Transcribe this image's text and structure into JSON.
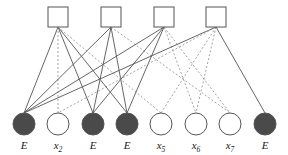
{
  "diagram": {
    "type": "bipartite-factor-graph",
    "width": 288,
    "height": 155,
    "background_color": "#ffffff"
  },
  "style": {
    "edge_solid_color": "#555555",
    "edge_dashed_color": "#999999",
    "edge_width": 0.9,
    "dash_pattern": "2,2",
    "node_stroke_color": "#555555",
    "node_stroke_width": 1.0,
    "check_fill": "#ffffff",
    "var_fill_erased": "#4a4a4a",
    "var_fill_known": "#ffffff",
    "label_color": "#1a1a1a"
  },
  "check_nodes": [
    {
      "id": "c1",
      "label": "",
      "cx": 58,
      "cy": 17,
      "size": 20
    },
    {
      "id": "c2",
      "label": "",
      "cx": 111,
      "cy": 17,
      "size": 20
    },
    {
      "id": "c3",
      "label": "",
      "cx": 164,
      "cy": 17,
      "size": 20
    },
    {
      "id": "c4",
      "label": "",
      "cx": 216,
      "cy": 17,
      "size": 20
    }
  ],
  "variable_nodes": [
    {
      "id": "v1",
      "label": "E",
      "sub": "",
      "cx": 24,
      "cy": 124,
      "r": 11,
      "state": "erased"
    },
    {
      "id": "v2",
      "label": "x",
      "sub": "2",
      "cx": 58,
      "cy": 124,
      "r": 11,
      "state": "known"
    },
    {
      "id": "v3",
      "label": "E",
      "sub": "",
      "cx": 93,
      "cy": 124,
      "r": 11,
      "state": "erased"
    },
    {
      "id": "v4",
      "label": "E",
      "sub": "",
      "cx": 127,
      "cy": 124,
      "r": 11,
      "state": "erased"
    },
    {
      "id": "v5",
      "label": "x",
      "sub": "5",
      "cx": 161,
      "cy": 124,
      "r": 11,
      "state": "known"
    },
    {
      "id": "v6",
      "label": "x",
      "sub": "6",
      "cx": 196,
      "cy": 124,
      "r": 11,
      "state": "known"
    },
    {
      "id": "v7",
      "label": "x",
      "sub": "7",
      "cx": 230,
      "cy": 124,
      "r": 11,
      "state": "known"
    },
    {
      "id": "v8",
      "label": "E",
      "sub": "",
      "cx": 265,
      "cy": 124,
      "r": 11,
      "state": "erased"
    }
  ],
  "edges": [
    {
      "from": "c1",
      "to": "v1",
      "style": "solid"
    },
    {
      "from": "c1",
      "to": "v2",
      "style": "dashed"
    },
    {
      "from": "c1",
      "to": "v3",
      "style": "solid"
    },
    {
      "from": "c1",
      "to": "v4",
      "style": "solid"
    },
    {
      "from": "c1",
      "to": "v5",
      "style": "dashed"
    },
    {
      "from": "c2",
      "to": "v1",
      "style": "solid"
    },
    {
      "from": "c2",
      "to": "v3",
      "style": "solid"
    },
    {
      "from": "c2",
      "to": "v4",
      "style": "solid"
    },
    {
      "from": "c2",
      "to": "v7",
      "style": "dashed"
    },
    {
      "from": "c3",
      "to": "v1",
      "style": "solid"
    },
    {
      "from": "c3",
      "to": "v3",
      "style": "solid"
    },
    {
      "from": "c3",
      "to": "v4",
      "style": "solid"
    },
    {
      "from": "c3",
      "to": "v6",
      "style": "dashed"
    },
    {
      "from": "c3",
      "to": "v7",
      "style": "dashed"
    },
    {
      "from": "c4",
      "to": "v1",
      "style": "solid"
    },
    {
      "from": "c4",
      "to": "v2",
      "style": "dashed"
    },
    {
      "from": "c4",
      "to": "v5",
      "style": "dashed"
    },
    {
      "from": "c4",
      "to": "v6",
      "style": "dashed"
    },
    {
      "from": "c4",
      "to": "v8",
      "style": "solid"
    }
  ]
}
